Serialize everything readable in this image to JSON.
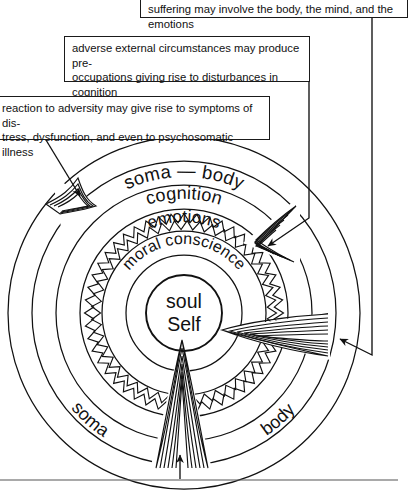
{
  "diagram": {
    "center": {
      "line1": "soul",
      "line2": "Self"
    },
    "rings": [
      {
        "id": "soma-body",
        "label": "soma — body"
      },
      {
        "id": "cognition",
        "label": "cognition"
      },
      {
        "id": "emotions",
        "label": "emotions"
      },
      {
        "id": "moral-conscience",
        "label": "moral conscience"
      }
    ],
    "bottom_labels": {
      "left": "soma",
      "right": "body"
    },
    "callouts": [
      {
        "id": "suffering",
        "lines": [
          "suffering may involve the body, the mind, and the emotions"
        ]
      },
      {
        "id": "adverse",
        "lines": [
          "adverse external circumstances may produce pre-",
          "occupations giving rise to disturbances in cognition"
        ]
      },
      {
        "id": "reaction",
        "lines": [
          "reaction to adversity may give rise to symptoms of dis-",
          "tress, dysfunction, and even to psychosomatic illness"
        ]
      }
    ],
    "arrows": [
      {
        "id": "arrow-upper-left",
        "depth": "shallow",
        "target_ring": "soma-body"
      },
      {
        "id": "arrow-upper-right",
        "depth": "medium",
        "target_ring": "cognition"
      },
      {
        "id": "arrow-right",
        "depth": "deep",
        "target_ring": "emotions"
      },
      {
        "id": "arrow-bottom",
        "depth": "deepest",
        "target_ring": "moral-conscience"
      }
    ],
    "colors": {
      "stroke": "#111111",
      "background": "#ffffff"
    }
  }
}
